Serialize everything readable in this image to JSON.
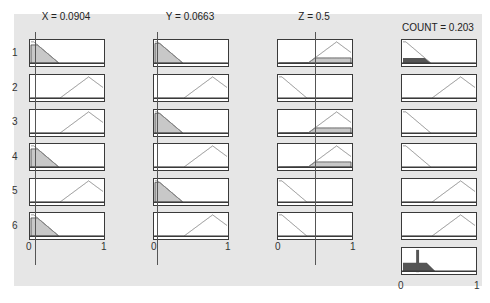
{
  "window": {
    "type": "fuzzy-rule-viewer"
  },
  "inputs": [
    {
      "name": "X",
      "title": "X = 0.0904",
      "value": 0.0904
    },
    {
      "name": "Y",
      "title": "Y = 0.0663",
      "value": 0.0663
    },
    {
      "name": "Z",
      "title": "Z = 0.5",
      "value": 0.5
    }
  ],
  "output": {
    "name": "COUNT",
    "title": "COUNT = 0.203",
    "value": 0.203
  },
  "rows": [
    "1",
    "2",
    "3",
    "4",
    "5",
    "6"
  ],
  "axis": {
    "min_label": "0",
    "max_label": "1"
  },
  "rules": [
    {
      "x": "low",
      "y": "low",
      "z": "high",
      "count": "low"
    },
    {
      "x": "high",
      "y": "high",
      "z": "low",
      "count": "high"
    },
    {
      "x": "high",
      "y": "low",
      "z": "high",
      "count": "low"
    },
    {
      "x": "low",
      "y": "high",
      "z": "high",
      "count": "low"
    },
    {
      "x": "high",
      "y": "low",
      "z": "low",
      "count": "high"
    },
    {
      "x": "low",
      "y": "high",
      "z": "low",
      "count": "high"
    }
  ],
  "colors": {
    "panel": "#e6e6e6",
    "box_border": "#3a3a3a",
    "mf_line": "#888888",
    "input_fill": "#c8c8c8",
    "output_fill": "#555555",
    "cursor_line": "#555555"
  }
}
